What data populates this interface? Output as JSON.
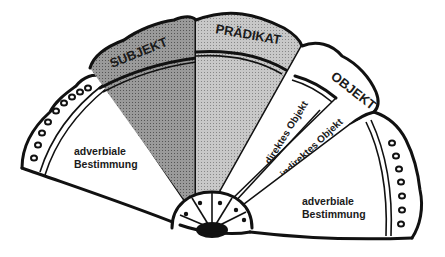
{
  "diagram": {
    "segments": [
      {
        "id": "adverbiale-left",
        "label_line1": "adverbiale",
        "label_line2": "Bestimmung",
        "fill": "#ffffff"
      },
      {
        "id": "subjekt",
        "label": "SUBJEKT",
        "fill": "#8c8c8c"
      },
      {
        "id": "praedikat",
        "label": "PRÄDIKAT",
        "fill": "#bdbdbd"
      },
      {
        "id": "objekt",
        "label": "OBJEKT",
        "fill": "#ffffff",
        "sub": [
          {
            "id": "direktes-objekt",
            "label": "direktes Objekt"
          },
          {
            "id": "indirektes-objekt",
            "label": "indirektes Objekt"
          }
        ]
      },
      {
        "id": "adverbiale-right",
        "label_line1": "adverbiale",
        "label_line2": "Bestimmung",
        "fill": "#ffffff"
      }
    ],
    "colors": {
      "outline": "#111111",
      "subjekt_fill": "#8c8c8c",
      "praedikat_fill": "#bdbdbd",
      "background": "#ffffff"
    }
  }
}
